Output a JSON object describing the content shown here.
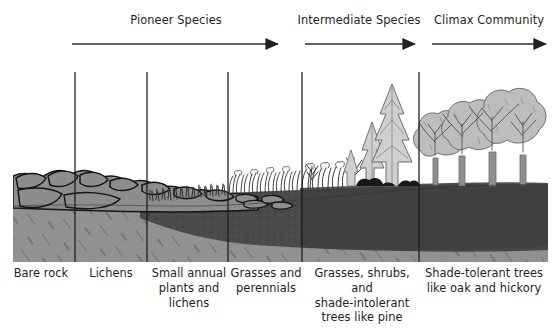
{
  "diagram": {
    "title_semantic": "ecological-succession-diagram",
    "colors": {
      "ink": "#231f20",
      "rock_fill": "#8d8d8d",
      "rock_outline": "#1a1a1a",
      "bedrock_fill": "#919191",
      "soil_dark": "#4a4a4a",
      "canopy_fill": "#bdbdbd",
      "conifer_fill": "#cfcfcf",
      "background": "#ffffff"
    }
  },
  "headers": [
    {
      "label": "Pioneer Species",
      "center_x": 176,
      "y": 14,
      "arrow": {
        "x1": 72,
        "x2": 278,
        "y": 44
      }
    },
    {
      "label": "Intermediate Species",
      "center_x": 359,
      "y": 14,
      "arrow": {
        "x1": 305,
        "x2": 415,
        "y": 44
      }
    },
    {
      "label": "Climax Community",
      "center_x": 489,
      "y": 14,
      "arrow": {
        "x1": 432,
        "x2": 546,
        "y": 44
      }
    }
  ],
  "dividers": [
    {
      "x": 75,
      "y1": 72,
      "y2": 262
    },
    {
      "x": 147,
      "y1": 72,
      "y2": 262
    },
    {
      "x": 228,
      "y1": 72,
      "y2": 262
    },
    {
      "x": 302,
      "y1": 72,
      "y2": 262
    },
    {
      "x": 419,
      "y1": 72,
      "y2": 262
    }
  ],
  "stages": [
    {
      "name": "bare-rock",
      "lines": [
        "Bare rock"
      ],
      "label_left": 8,
      "label_width": 66,
      "label_top": 266
    },
    {
      "name": "lichens",
      "lines": [
        "Lichens"
      ],
      "label_left": 77,
      "label_width": 68,
      "label_top": 266
    },
    {
      "name": "small-annual-plants-and-lichens",
      "lines": [
        "Small annual",
        "plants and",
        "lichens"
      ],
      "label_left": 150,
      "label_width": 78,
      "label_top": 266
    },
    {
      "name": "grasses-and-perennials",
      "lines": [
        "Grasses and",
        "perennials"
      ],
      "label_left": 230,
      "label_width": 72,
      "label_top": 266
    },
    {
      "name": "grasses-shrubs-shade-intolerant-trees",
      "lines": [
        "Grasses, shrubs, and",
        "shade-intolerant",
        "trees like pine"
      ],
      "label_left": 303,
      "label_width": 116,
      "label_top": 266
    },
    {
      "name": "shade-tolerant-trees",
      "lines": [
        "Shade-tolerant trees",
        "like oak and hickory"
      ],
      "label_left": 421,
      "label_width": 124,
      "label_top": 266
    }
  ],
  "terrain": {
    "ground_left": 13,
    "ground_right": 548,
    "ground_bottom": 262,
    "soil_note": "dark organic soil layer thickens left-to-right over lighter hatched bedrock"
  }
}
